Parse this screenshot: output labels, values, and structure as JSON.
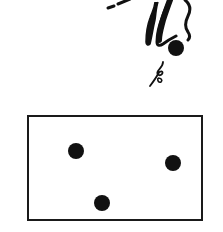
{
  "illustration": {
    "figure": {
      "description": "stylized falling legs with a ball and a curly tail",
      "stroke_color": "#111111"
    },
    "box": {
      "border_color": "#1a1a1a",
      "dots": [
        {
          "x": 47,
          "y": 34
        },
        {
          "x": 144,
          "y": 46
        },
        {
          "x": 73,
          "y": 86
        }
      ],
      "dot_color": "#111111"
    }
  }
}
